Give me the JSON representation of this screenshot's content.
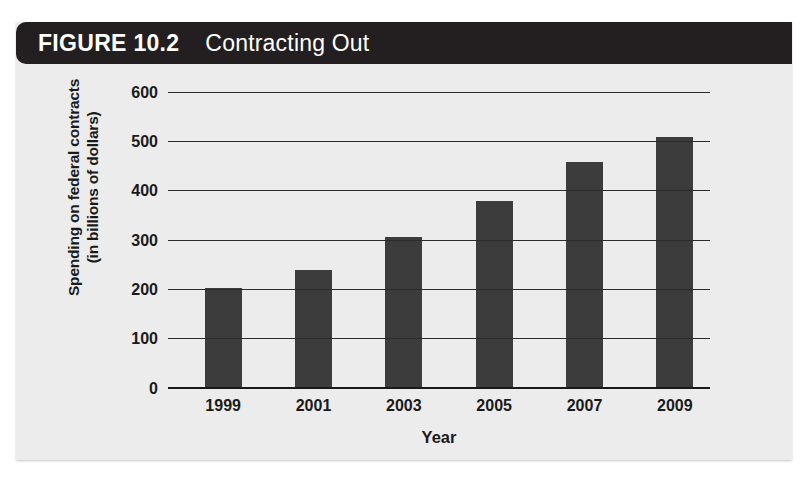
{
  "figure": {
    "number_label": "FIGURE 10.2",
    "title": "Contracting Out",
    "title_bar_color": "#231f20",
    "panel_color": "#ececec"
  },
  "chart_data": {
    "type": "bar",
    "title": "Contracting Out",
    "categories": [
      "1999",
      "2001",
      "2003",
      "2005",
      "2007",
      "2009"
    ],
    "values": [
      202,
      237,
      305,
      378,
      458,
      508
    ],
    "xlabel": "Year",
    "ylabel": "Spending on federal contracts (in billions of dollars)",
    "ylabel_line1": "Spending on federal contracts",
    "ylabel_line2": "(in billions of dollars)",
    "ylim": [
      0,
      600
    ],
    "ytick_values": [
      0,
      100,
      200,
      300,
      400,
      500,
      600
    ],
    "ytick_labels": [
      "0",
      "100",
      "200",
      "300",
      "400",
      "500",
      "600"
    ],
    "grid": true,
    "legend": false,
    "bar_color": "#3c3c3c",
    "gridline_color": "#2b2b2b"
  }
}
